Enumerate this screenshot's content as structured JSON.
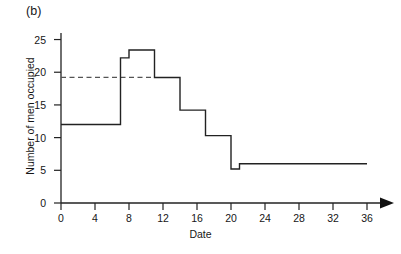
{
  "figure": {
    "panel_label": "(b)"
  },
  "chart_data": {
    "type": "line",
    "title": "",
    "subtitle": "",
    "xlabel": "Date",
    "ylabel": "Number of men occupied",
    "xlim": [
      0,
      36
    ],
    "ylim": [
      0,
      26
    ],
    "grid": false,
    "legend": "none",
    "x_ticks": [
      0,
      4,
      8,
      12,
      16,
      20,
      24,
      28,
      32,
      36
    ],
    "x_tick_labels": [
      "0",
      "4",
      "8",
      "12",
      "16",
      "20",
      "24",
      "28",
      "32",
      "36"
    ],
    "y_ticks": [
      0,
      5,
      10,
      15,
      20,
      25
    ],
    "y_tick_labels": [
      "0",
      "5",
      "10",
      "15",
      "20",
      "25"
    ],
    "x_axis_arrow": true,
    "series": [
      {
        "name": "Men occupied",
        "style": "step-post",
        "color": "#222222",
        "steps": [
          {
            "x_start": 0,
            "x_end": 7,
            "value": 12.0
          },
          {
            "x_start": 7,
            "x_end": 8,
            "value": 22.2
          },
          {
            "x_start": 8,
            "x_end": 11,
            "value": 23.4
          },
          {
            "x_start": 11,
            "x_end": 14,
            "value": 19.2
          },
          {
            "x_start": 14,
            "x_end": 17,
            "value": 14.2
          },
          {
            "x_start": 17,
            "x_end": 20,
            "value": 10.3
          },
          {
            "x_start": 20,
            "x_end": 21,
            "value": 5.2
          },
          {
            "x_start": 21,
            "x_end": 36,
            "value": 6.0
          }
        ]
      }
    ],
    "annotations": [
      {
        "name": "average-level-line",
        "style": "dashed",
        "color": "#555555",
        "y": 19.2,
        "x_start": 0,
        "x_end": 11,
        "label": ""
      }
    ]
  }
}
